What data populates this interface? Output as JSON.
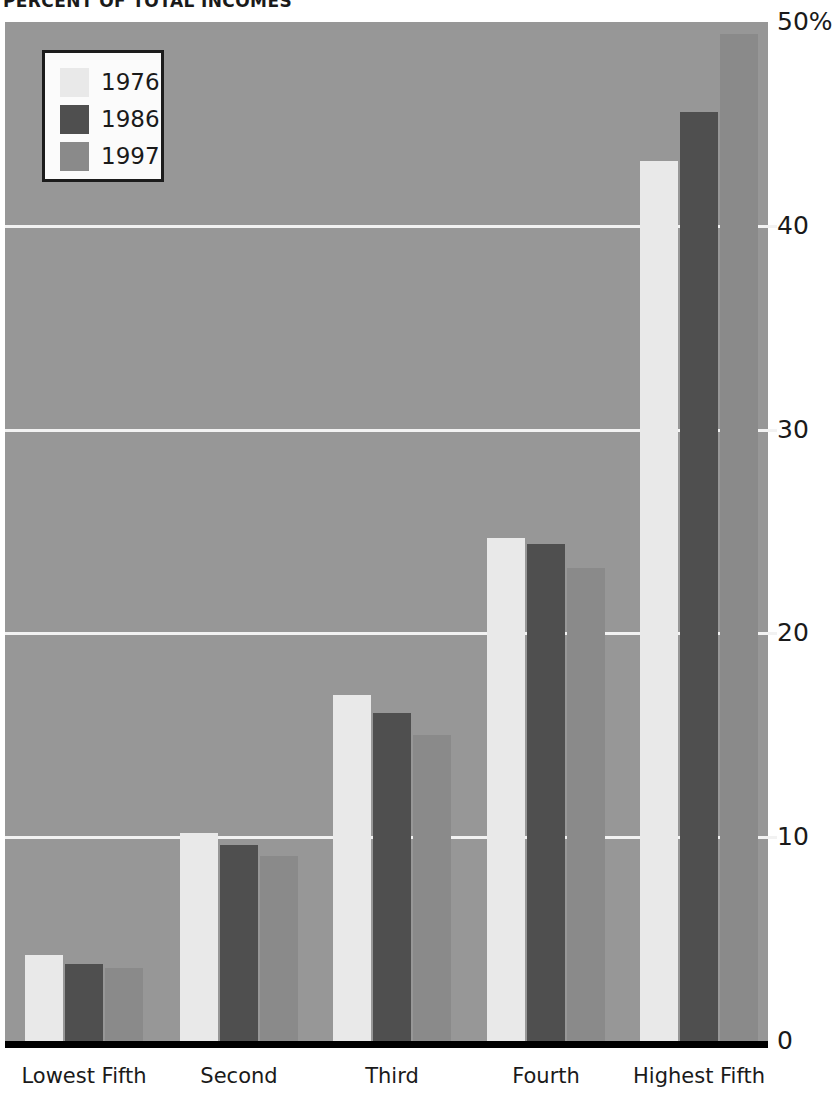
{
  "chart_data": {
    "type": "bar",
    "title": "PERCENT OF TOTAL INCOMES",
    "xlabel": "",
    "ylabel": "",
    "ylim": [
      0,
      50
    ],
    "grid": true,
    "legend_position": "top-left",
    "categories": [
      "Lowest Fifth",
      "Second",
      "Third",
      "Fourth",
      "Highest Fifth"
    ],
    "ytick_labels": [
      "50%",
      "40",
      "30",
      "20",
      "10",
      "0"
    ],
    "ytick_values": [
      50,
      40,
      30,
      20,
      10,
      0
    ],
    "series": [
      {
        "name": "1976",
        "color": "#e9e9e9",
        "values": [
          4.2,
          10.2,
          17.0,
          24.7,
          43.2
        ]
      },
      {
        "name": "1986",
        "color": "#4f4f4f",
        "values": [
          3.8,
          9.6,
          16.1,
          24.4,
          45.6
        ]
      },
      {
        "name": "1997",
        "color": "#8a8a8a",
        "values": [
          3.6,
          9.1,
          15.0,
          23.2,
          49.4
        ]
      }
    ]
  },
  "legend": {
    "entries": [
      {
        "label": "1976"
      },
      {
        "label": "1986"
      },
      {
        "label": "1997"
      }
    ]
  },
  "colors": {
    "plot_background": "#979797",
    "gridline": "#f2f2f2",
    "axis": "#000000",
    "text": "#1a1a1a",
    "page_background": "#ffffff"
  }
}
